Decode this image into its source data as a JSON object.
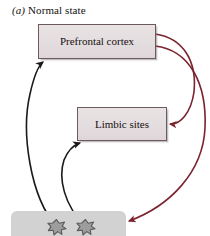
{
  "figure": {
    "panel_letter": "(a)",
    "title": "Normal state",
    "background_color": "#ffffff"
  },
  "nodes": [
    {
      "id": "prefrontal",
      "label": "Prefrontal cortex",
      "fill_color": "#e4dddf",
      "border_color": "#6d5a5d"
    },
    {
      "id": "limbic",
      "label": "Limbic sites",
      "fill_color": "#e4dddf",
      "border_color": "#6d5a5d"
    }
  ],
  "tissue_region": {
    "name": "neuron-field",
    "fill_color": "#d2d2d2"
  },
  "neurons": [
    {
      "name": "neuron-cell-left",
      "fill_color": "#9d9d9d",
      "outline_color": "#5a5a5a"
    },
    {
      "name": "neuron-cell-right",
      "fill_color": "#9d9d9d",
      "outline_color": "#5a5a5a"
    }
  ],
  "edges": [
    {
      "name": "prefrontal-to-limbic",
      "color": "#7b2430",
      "from": "prefrontal",
      "to": "limbic",
      "arrowhead": true
    },
    {
      "name": "prefrontal-to-neuron-field",
      "color": "#7b2430",
      "from": "prefrontal",
      "to": "neuron-field",
      "arrowhead": true
    },
    {
      "name": "neuron-to-prefrontal",
      "color": "#1a1a1a",
      "from": "neuron-cell-left",
      "to": "prefrontal",
      "arrowhead": true
    },
    {
      "name": "neuron-to-limbic",
      "color": "#1a1a1a",
      "from": "neuron-cell-right",
      "to": "limbic",
      "arrowhead": true
    }
  ]
}
